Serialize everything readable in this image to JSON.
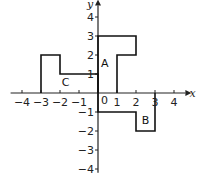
{
  "diagram": {
    "type": "coordinate-grid-shapes",
    "x_axis": {
      "label": "x",
      "range": [
        -4,
        4
      ],
      "ticks": [
        -4,
        -3,
        -2,
        -1,
        1,
        2,
        3,
        4
      ],
      "tick_labels": [
        "−4",
        "−3",
        "−2",
        "−1",
        "1",
        "2",
        "3",
        "4"
      ]
    },
    "y_axis": {
      "label": "y",
      "range": [
        -4,
        4
      ],
      "ticks": [
        -4,
        -3,
        -2,
        -1,
        1,
        2,
        3,
        4
      ],
      "tick_labels": [
        "−4",
        "−3",
        "−2",
        "−1",
        "1",
        "2",
        "3",
        "4"
      ]
    },
    "origin_label": "0",
    "shapes": [
      {
        "name": "A",
        "label_at": [
          0.35,
          1.6
        ],
        "points": [
          [
            0,
            0
          ],
          [
            0,
            3
          ],
          [
            2,
            3
          ],
          [
            2,
            2
          ],
          [
            1,
            2
          ],
          [
            1,
            0
          ]
        ]
      },
      {
        "name": "B",
        "label_at": [
          2.5,
          -1.4
        ],
        "points": [
          [
            0,
            0
          ],
          [
            0,
            -1
          ],
          [
            2,
            -1
          ],
          [
            2,
            -2
          ],
          [
            3,
            -2
          ],
          [
            3,
            0
          ]
        ]
      },
      {
        "name": "C",
        "label_at": [
          -1.7,
          0.6
        ],
        "points": [
          [
            0,
            0
          ],
          [
            0,
            1
          ],
          [
            -2,
            1
          ],
          [
            -2,
            2
          ],
          [
            -3,
            2
          ],
          [
            -3,
            0
          ]
        ]
      }
    ]
  }
}
